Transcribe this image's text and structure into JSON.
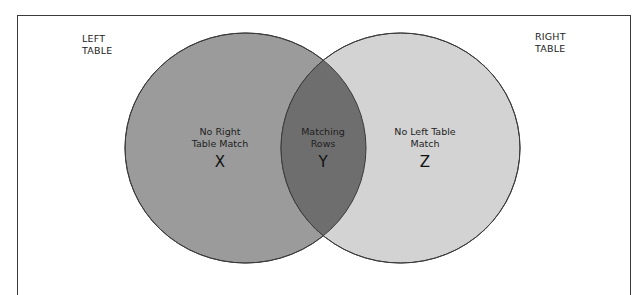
{
  "diagram": {
    "type": "venn",
    "labels": {
      "left_table": [
        "LEFT",
        "TABLE"
      ],
      "right_table": [
        "RIGHT",
        "TABLE"
      ]
    },
    "regions": {
      "left_only": {
        "lines": [
          "No Right",
          "Table Match"
        ],
        "letter": "X"
      },
      "intersection": {
        "lines": [
          "Matching",
          "Rows"
        ],
        "letter": "Y"
      },
      "right_only": {
        "lines": [
          "No Left Table",
          "Match"
        ],
        "letter": "Z"
      }
    },
    "colors": {
      "left_circle": "#9b9b9b",
      "right_circle": "#d3d3d3",
      "intersection": "#6e6e6e",
      "outline": "#3a3a3a",
      "frame": "#3a3a3a",
      "background": "#ffffff"
    }
  }
}
